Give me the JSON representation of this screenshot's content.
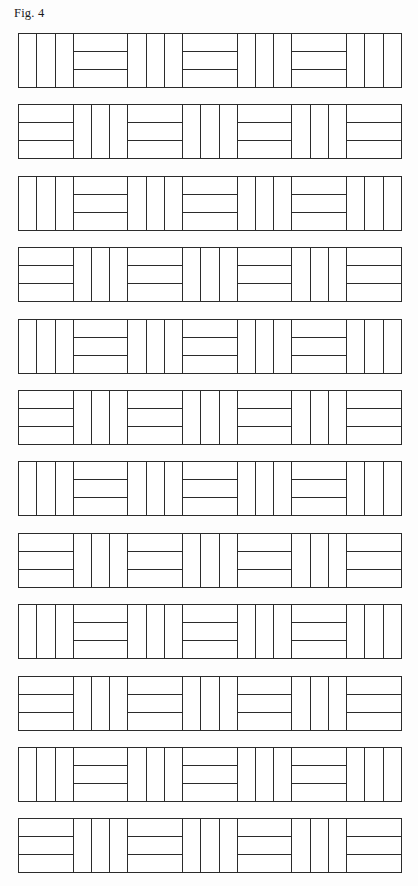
{
  "figure": {
    "caption": "Fig. 4",
    "kind": "patent-line-drawing",
    "stroke_color": "#2b2b2b",
    "fill_color": "#ffffff",
    "background_color": "#fdfdfd"
  },
  "pattern": {
    "row_count": 12,
    "blocks_per_row": 7,
    "strips_per_block": 3,
    "block_size_px": 55,
    "row_gap_px": 16,
    "orientations": {
      "vertical": "vertical",
      "horizontal": "horizontal"
    },
    "rows": [
      {
        "index": 1,
        "start": "vertical",
        "blocks": [
          "vertical",
          "horizontal",
          "vertical",
          "horizontal",
          "vertical",
          "horizontal",
          "vertical"
        ]
      },
      {
        "index": 2,
        "start": "horizontal",
        "blocks": [
          "horizontal",
          "vertical",
          "horizontal",
          "vertical",
          "horizontal",
          "vertical",
          "horizontal"
        ]
      },
      {
        "index": 3,
        "start": "vertical",
        "blocks": [
          "vertical",
          "horizontal",
          "vertical",
          "horizontal",
          "vertical",
          "horizontal",
          "vertical"
        ]
      },
      {
        "index": 4,
        "start": "horizontal",
        "blocks": [
          "horizontal",
          "vertical",
          "horizontal",
          "vertical",
          "horizontal",
          "vertical",
          "horizontal"
        ]
      },
      {
        "index": 5,
        "start": "vertical",
        "blocks": [
          "vertical",
          "horizontal",
          "vertical",
          "horizontal",
          "vertical",
          "horizontal",
          "vertical"
        ]
      },
      {
        "index": 6,
        "start": "horizontal",
        "blocks": [
          "horizontal",
          "vertical",
          "horizontal",
          "vertical",
          "horizontal",
          "vertical",
          "horizontal"
        ]
      },
      {
        "index": 7,
        "start": "vertical",
        "blocks": [
          "vertical",
          "horizontal",
          "vertical",
          "horizontal",
          "vertical",
          "horizontal",
          "vertical"
        ]
      },
      {
        "index": 8,
        "start": "horizontal",
        "blocks": [
          "horizontal",
          "vertical",
          "horizontal",
          "vertical",
          "horizontal",
          "vertical",
          "horizontal"
        ]
      },
      {
        "index": 9,
        "start": "vertical",
        "blocks": [
          "vertical",
          "horizontal",
          "vertical",
          "horizontal",
          "vertical",
          "horizontal",
          "vertical"
        ]
      },
      {
        "index": 10,
        "start": "horizontal",
        "blocks": [
          "horizontal",
          "vertical",
          "horizontal",
          "vertical",
          "horizontal",
          "vertical",
          "horizontal"
        ]
      },
      {
        "index": 11,
        "start": "vertical",
        "blocks": [
          "vertical",
          "horizontal",
          "vertical",
          "horizontal",
          "vertical",
          "horizontal",
          "vertical"
        ]
      },
      {
        "index": 12,
        "start": "horizontal",
        "blocks": [
          "horizontal",
          "vertical",
          "horizontal",
          "vertical",
          "horizontal",
          "vertical",
          "horizontal"
        ]
      }
    ]
  }
}
